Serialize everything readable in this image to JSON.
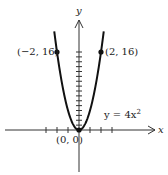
{
  "chart_data": {
    "type": "line",
    "title": "",
    "equation_label": "y = 4x²",
    "xlabel": "x",
    "ylabel": "y",
    "series": [
      {
        "name": "y = 4x^2",
        "x": [
          -2.2,
          -2,
          -1.5,
          -1,
          -0.5,
          0,
          0.5,
          1,
          1.5,
          2,
          2.2
        ],
        "values": [
          19.36,
          16,
          9,
          4,
          1,
          0,
          1,
          4,
          9,
          16,
          19.36
        ]
      }
    ],
    "points": [
      {
        "x": -2,
        "y": 16,
        "label": "(−2, 16)"
      },
      {
        "x": 2,
        "y": 16,
        "label": "(2, 16)"
      },
      {
        "x": 0,
        "y": 0,
        "label": "(0, 0)"
      }
    ],
    "x_ticks": [
      -3,
      -2,
      -1,
      1,
      2,
      3
    ],
    "y_ticks": [
      1,
      2,
      3,
      4,
      5,
      6,
      7,
      8,
      9,
      10,
      11,
      12,
      13,
      14,
      15,
      16
    ],
    "grid": false
  },
  "labels": {
    "left_point": "(−2, 16)",
    "right_point": "(2, 16)",
    "origin": "(0, 0)",
    "equation": "y = 4x",
    "equation_exp": "2",
    "x_axis": "x",
    "y_axis": "y"
  }
}
